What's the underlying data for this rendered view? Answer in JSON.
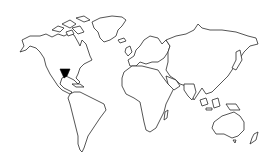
{
  "map": {
    "title": "World map outline",
    "background": "#ffffff",
    "outline_color": "#2a2a2a",
    "highlight": {
      "region": "Texas (United States)",
      "color": "#000000",
      "shape": "triangle"
    },
    "continents": [
      "North America",
      "Greenland",
      "South America",
      "Europe",
      "Africa",
      "Asia",
      "Australia",
      "New Zealand"
    ]
  }
}
